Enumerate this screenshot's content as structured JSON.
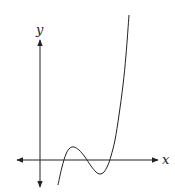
{
  "chart_data": {
    "type": "line",
    "title": "",
    "xlabel": "x",
    "ylabel": "y",
    "grid": false,
    "legend": null,
    "axes": {
      "x_axis_arrows": "both",
      "y_axis_arrows": "both",
      "ticks": []
    },
    "series": [
      {
        "name": "f(x)",
        "points_px": [
          [
            58,
            185
          ],
          [
            62,
            167
          ],
          [
            66,
            154
          ],
          [
            70,
            148
          ],
          [
            74,
            147
          ],
          [
            79,
            150
          ],
          [
            85,
            157
          ],
          [
            91,
            166
          ],
          [
            96,
            172
          ],
          [
            100,
            174
          ],
          [
            104,
            172
          ],
          [
            108,
            165
          ],
          [
            111,
            156
          ],
          [
            115,
            140
          ],
          [
            119,
            115
          ],
          [
            123,
            85
          ],
          [
            126,
            55
          ],
          [
            129,
            15
          ]
        ]
      }
    ],
    "features": {
      "local_max": "above x-axis, right of y-axis",
      "local_min": "below x-axis",
      "x_intercepts": 3
    }
  },
  "labels": {
    "x_axis": "x",
    "y_axis": "y"
  }
}
